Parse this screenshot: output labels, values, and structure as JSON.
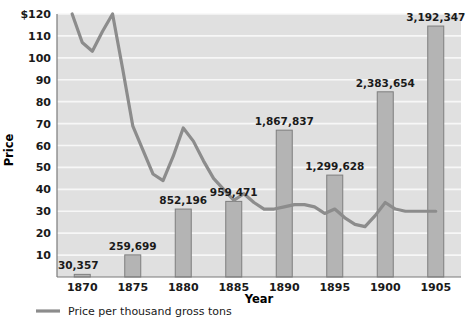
{
  "chart_data": {
    "type": "bar",
    "title": "",
    "xlabel": "Year",
    "ylabel": "Price",
    "ylim": [
      0,
      120
    ],
    "grid": true,
    "legend_position": "bottom-left",
    "categories": [
      "1870",
      "1875",
      "1880",
      "1885",
      "1890",
      "1895",
      "1900",
      "1905"
    ],
    "bar_series": {
      "name": "Production (gross tons)",
      "value_labels": [
        "30,357",
        "259,699",
        "852,196",
        "959,471",
        "1,867,837",
        "1,299,628",
        "2,383,654",
        "3,192,347"
      ],
      "values": [
        30357,
        259699,
        852196,
        959471,
        1867837,
        1299628,
        2383654,
        3192347
      ],
      "plotted_heights": [
        1.2,
        10.1,
        31.0,
        34.5,
        67.0,
        46.5,
        84.5,
        114.5
      ]
    },
    "line_series": {
      "name": "Price per thousand gross tons",
      "x": [
        1869.0,
        1870.0,
        1871.0,
        1872.0,
        1873.0,
        1874.0,
        1875.0,
        1876.0,
        1877.0,
        1878.0,
        1879.0,
        1880.0,
        1881.0,
        1882.0,
        1883.0,
        1884.0,
        1885.0,
        1886.0,
        1887.0,
        1888.0,
        1889.0,
        1890.0,
        1891.0,
        1892.0,
        1893.0,
        1894.0,
        1895.0,
        1896.0,
        1897.0,
        1898.0,
        1899.0,
        1900.0,
        1901.0,
        1902.0,
        1903.0,
        1904.0,
        1905.0
      ],
      "y": [
        128,
        107,
        103,
        112,
        120,
        95,
        69,
        58,
        47,
        44,
        55,
        68,
        62,
        53,
        45,
        40,
        35,
        38,
        34,
        31,
        31,
        32,
        33,
        33,
        32,
        29,
        31,
        27,
        24,
        23,
        28,
        34,
        31,
        30,
        30,
        30,
        30
      ]
    },
    "y_ticks": [
      {
        "value": 120,
        "label": "$120"
      },
      {
        "value": 110,
        "label": "110"
      },
      {
        "value": 100,
        "label": "100"
      },
      {
        "value": 90,
        "label": "90"
      },
      {
        "value": 80,
        "label": "80"
      },
      {
        "value": 70,
        "label": "70"
      },
      {
        "value": 60,
        "label": "60"
      },
      {
        "value": 50,
        "label": "50"
      },
      {
        "value": 40,
        "label": "40"
      },
      {
        "value": 30,
        "label": "30"
      },
      {
        "value": 20,
        "label": "20"
      },
      {
        "value": 10,
        "label": "10"
      }
    ],
    "colors": {
      "plot_background": "#e0e0e0",
      "gridline": "#f7f7f7",
      "bar_fill": "#b4b4b4",
      "bar_stroke": "#7e7e7e",
      "line": "#8c8c8c",
      "axis": "#7a7a7a",
      "text": "#1a1a1a"
    }
  },
  "axis": {
    "x_title": "Year",
    "y_title": "Price"
  },
  "legend": {
    "entries": [
      {
        "label": "Price per thousand gross tons",
        "type": "line",
        "color": "#8c8c8c"
      }
    ]
  }
}
